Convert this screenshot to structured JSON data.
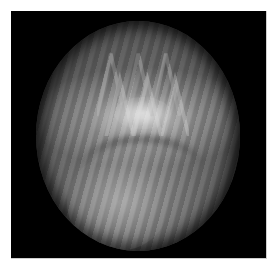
{
  "image": {
    "description": "Grayscale circular scan/endoscopic-style view on black square background",
    "colors": {
      "page_background": "#ffffff",
      "frame_background": "#000000",
      "frame_border": "#cfcfcf",
      "disc_mid": "#7a7a7a",
      "disc_edge": "#1e1e1e",
      "highlight": "#dcdcdc"
    },
    "regions": [
      {
        "name": "upper-zigzag-pattern",
        "tone": "mid-gray"
      },
      {
        "name": "central-bright-band",
        "tone": "light-gray"
      },
      {
        "name": "curved-dark-arc",
        "tone": "dark-gray"
      },
      {
        "name": "lower-bright-lobe",
        "tone": "light-gray"
      }
    ]
  }
}
